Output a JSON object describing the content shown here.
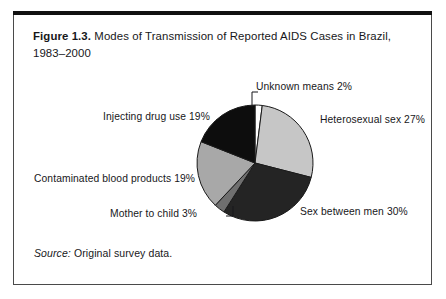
{
  "figure": {
    "number_label": "Figure 1.3.",
    "title_rest": " Modes of Transmission of Reported AIDS Cases in Brazil, 1983–2000",
    "source_prefix": "Source:",
    "source_text": " Original survey data."
  },
  "colors": {
    "frame_rule": "#111111",
    "frame_border": "#4a4a4a",
    "background": "#ffffff",
    "text": "#17171a",
    "slice_unknown": "#ffffff",
    "slice_heterosexual": "#c6c6c6",
    "slice_sex_between_men": "#242424",
    "slice_mother_to_child": "#6f6f6f",
    "slice_blood_products": "#a8a8a8",
    "slice_injecting_drugs": "#0d0d0d",
    "slice_outline": "#1a1a1a"
  },
  "chart_data": {
    "type": "pie",
    "title": "Figure 1.3. Modes of Transmission of Reported AIDS Cases in Brazil, 1983–2000",
    "subtitle": "",
    "xlabel": "",
    "ylabel": "",
    "legend_position": "callout-labels",
    "grid": false,
    "start_angle_deg": 0,
    "direction": "clockwise",
    "units": "percent",
    "categories": [
      "Unknown means",
      "Heterosexual sex",
      "Sex between men",
      "Mother to child",
      "Contaminated blood products",
      "Injecting drug use"
    ],
    "values": [
      2,
      27,
      30,
      3,
      19,
      19
    ],
    "slices": [
      {
        "name": "Unknown means",
        "value": 2,
        "label": "Unknown means 2%",
        "color": "#ffffff"
      },
      {
        "name": "Heterosexual sex",
        "value": 27,
        "label": "Heterosexual sex 27%",
        "color": "#c6c6c6"
      },
      {
        "name": "Sex between men",
        "value": 30,
        "label": "Sex between men 30%",
        "color": "#242424"
      },
      {
        "name": "Mother to child",
        "value": 3,
        "label": "Mother to child 3%",
        "color": "#6f6f6f"
      },
      {
        "name": "Contaminated blood products",
        "value": 19,
        "label": "Contaminated blood products 19%",
        "color": "#a8a8a8"
      },
      {
        "name": "Injecting drug use",
        "value": 19,
        "label": "Injecting drug use 19%",
        "color": "#0d0d0d"
      }
    ]
  }
}
